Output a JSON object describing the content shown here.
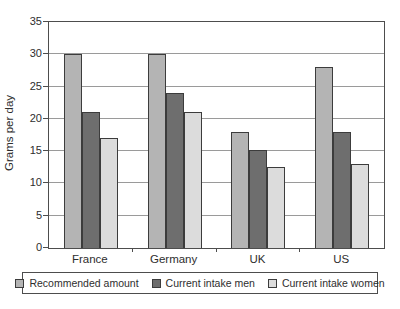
{
  "chart_data": {
    "type": "bar",
    "title": "",
    "xlabel": "",
    "ylabel": "Grams per day",
    "ylim": [
      0,
      35
    ],
    "yticks": [
      0,
      5,
      10,
      15,
      20,
      25,
      30,
      35
    ],
    "grid": true,
    "legend_position": "bottom",
    "categories": [
      "France",
      "Germany",
      "UK",
      "US"
    ],
    "series": [
      {
        "name": "Recommended amount",
        "color": "#b4b4b4",
        "values": [
          30,
          30,
          18,
          28
        ]
      },
      {
        "name": "Current intake men",
        "color": "#6e6e6e",
        "values": [
          21,
          24,
          15.2,
          18
        ]
      },
      {
        "name": "Current intake women",
        "color": "#dcdcdc",
        "values": [
          17,
          21,
          12.5,
          13
        ]
      }
    ],
    "colors": {
      "plot_border": "#4d4d4d",
      "gridline": "#9a9a9a",
      "bar_border": "#3c3c3c",
      "text": "#2e2e2e",
      "background": "#ffffff"
    }
  }
}
